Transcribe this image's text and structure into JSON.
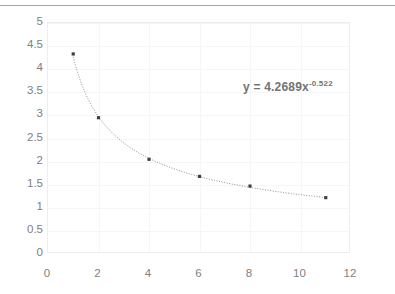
{
  "chart_data": {
    "type": "scatter",
    "title": "",
    "xlabel": "",
    "ylabel": "",
    "xlim": [
      0,
      12
    ],
    "ylim": [
      0,
      5
    ],
    "xticks": [
      "0",
      "2",
      "4",
      "6",
      "8",
      "10",
      "12"
    ],
    "yticks": [
      "0",
      "0.5",
      "1",
      "1.5",
      "2",
      "2.5",
      "3",
      "3.5",
      "4",
      "4.5",
      "5"
    ],
    "xtick_values": [
      0,
      2,
      4,
      6,
      8,
      10,
      12
    ],
    "ytick_values": [
      0,
      0.5,
      1,
      1.5,
      2,
      2.5,
      3,
      3.5,
      4,
      4.5,
      5
    ],
    "grid": true,
    "legend": false,
    "x": [
      1,
      2,
      4,
      6,
      8,
      11
    ],
    "values": [
      4.33,
      2.95,
      2.05,
      1.68,
      1.47,
      1.22
    ],
    "series": [
      {
        "name": "data",
        "marker": "square",
        "marker_color": "#404040",
        "x": [
          1,
          2,
          4,
          6,
          8,
          11
        ],
        "values": [
          4.33,
          2.95,
          2.05,
          1.68,
          1.47,
          1.22
        ]
      }
    ],
    "trendline": {
      "type": "power",
      "style": "dotted",
      "color": "#8c8c8c",
      "coefficient": 4.2689,
      "exponent": -0.522,
      "x_start": 1,
      "x_end": 11
    },
    "annotations": [
      {
        "name": "trendline-equation",
        "prefix": "y = 4.2689x",
        "exponent": "-0.522",
        "color": "#737373"
      }
    ]
  },
  "colors": {
    "top_rule": "#a6a6a6",
    "plot_border": "#eceff1",
    "gridline": "#f4f6f7",
    "tick_label": "#808080",
    "marker": "#404040",
    "trendline": "#8c8c8c"
  }
}
